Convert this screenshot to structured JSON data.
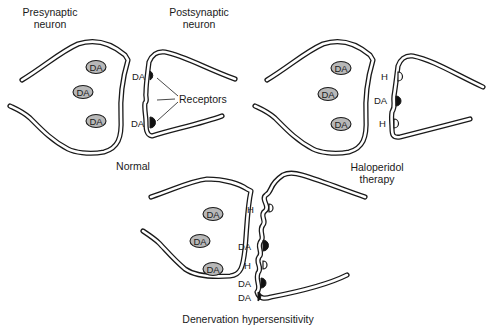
{
  "panels": {
    "normal": {
      "caption": "Normal",
      "presynaptic_label_line1": "Presynaptic",
      "presynaptic_label_line2": "neuron",
      "postsynaptic_label_line1": "Postsynaptic",
      "postsynaptic_label_line2": "neuron",
      "vesicles": [
        "DA",
        "DA",
        "DA"
      ],
      "receptor_labels": [
        "DA",
        "DA"
      ],
      "receptors_callout": "Receptors"
    },
    "haloperidol": {
      "caption_line1": "Haloperidol",
      "caption_line2": "therapy",
      "vesicles": [
        "DA",
        "DA",
        "DA"
      ],
      "receptor_labels": [
        "H",
        "DA",
        "H"
      ]
    },
    "denervation": {
      "caption": "Denervation hypersensitivity",
      "vesicles": [
        "DA",
        "DA",
        "DA"
      ],
      "receptor_labels": [
        "H",
        "DA",
        "H",
        "DA",
        "DA"
      ]
    }
  },
  "colors": {
    "line": "#1a1a1a",
    "vesicle_fill": "#b8b8b8",
    "bound_receptor_fill": "#111111",
    "background": "#ffffff"
  }
}
